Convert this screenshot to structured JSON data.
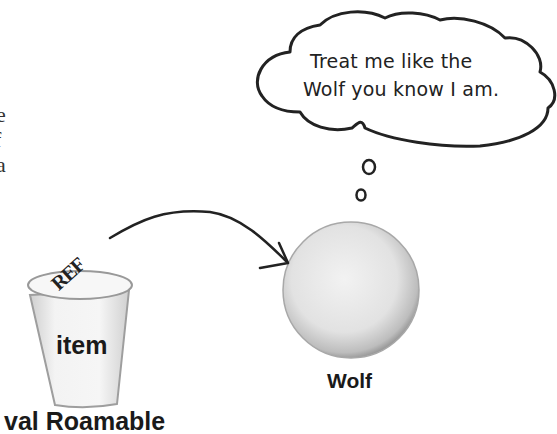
{
  "left_text_fragments": [
    "e",
    "f",
    "a"
  ],
  "thought_bubble": {
    "line1": "Treat me like the",
    "line2": "Wolf you know I am."
  },
  "reference": {
    "label": "REF",
    "variable_label": "item",
    "declaration_label": "val Roamable"
  },
  "object": {
    "label": "Wolf"
  },
  "colors": {
    "ink": "#222222",
    "object_fill": "#e4e4e4",
    "object_shade": "#9a9a9a"
  }
}
